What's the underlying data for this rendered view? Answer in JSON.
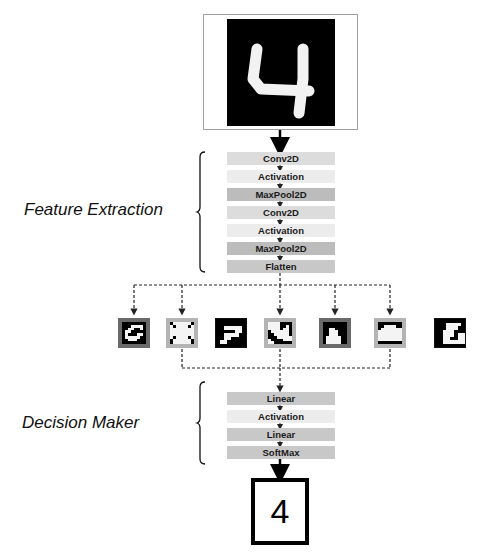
{
  "input": {
    "caption": "Input handwritten digit image",
    "digit": "4"
  },
  "feature_extraction": {
    "label": "Feature Extraction",
    "layers": [
      {
        "name": "Conv2D",
        "color": "#dcdcdc"
      },
      {
        "name": "Activation",
        "color": "#ececec"
      },
      {
        "name": "MaxPool2D",
        "color": "#bcbcbc"
      },
      {
        "name": "Conv2D",
        "color": "#dcdcdc"
      },
      {
        "name": "Activation",
        "color": "#ececec"
      },
      {
        "name": "MaxPool2D",
        "color": "#bcbcbc"
      },
      {
        "name": "Flatten",
        "color": "#c8c8c8"
      }
    ]
  },
  "feature_maps": [
    {
      "id": 1,
      "border": "#6a6a6a",
      "pattern": "curve"
    },
    {
      "id": 2,
      "border": "#b4b4b4",
      "pattern": "cross"
    },
    {
      "id": 3,
      "border": "#111111",
      "pattern": "seven"
    },
    {
      "id": 4,
      "border": "#b4b4b4",
      "pattern": "corner"
    },
    {
      "id": 5,
      "border": "#6a6a6a",
      "pattern": "block"
    },
    {
      "id": 6,
      "border": "#b4b4b4",
      "pattern": "blob"
    },
    {
      "id": 7,
      "border": "#111111",
      "pattern": "step"
    }
  ],
  "decision_maker": {
    "label": "Decision Maker",
    "layers": [
      {
        "name": "Linear",
        "color": "#c8c8c8"
      },
      {
        "name": "Activation",
        "color": "#ececec"
      },
      {
        "name": "Linear",
        "color": "#c8c8c8"
      },
      {
        "name": "SoftMax",
        "color": "#c8c8c8"
      }
    ]
  },
  "output": {
    "prediction": "4"
  }
}
